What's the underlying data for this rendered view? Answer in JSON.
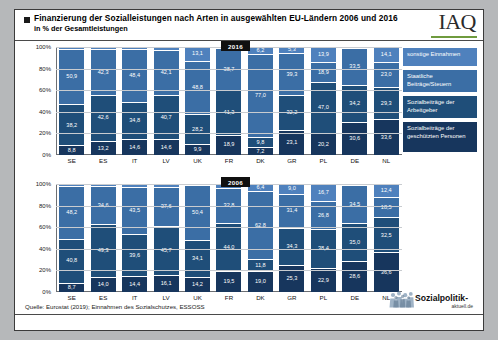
{
  "header": {
    "title_line1": "Finanzierung der Sozialleistungen nach Arten in ausgewählten EU-Ländern 2006 und 2016",
    "title_line2": "in % der Gesamtleistungen",
    "logo": "IAQ"
  },
  "footer": {
    "source": "Quelle: Eurostat (2019); Einnahmen des Sozialschutzes, ESSOSS",
    "brand_main": "Sozialpolitik-",
    "brand_sub": "aktuell.de"
  },
  "legend": {
    "items": [
      {
        "label": "sonstige Einnahmen",
        "color": "#4f81bd"
      },
      {
        "label": "Staatliche Beiträge/Steuern",
        "color": "#3b6ea5"
      },
      {
        "label": "Sozialbeiträge der Arbeitgeber",
        "color": "#1f4e79"
      },
      {
        "label": "Sozialbeiträge der geschützten Personen",
        "color": "#17365d"
      }
    ]
  },
  "axis": {
    "yticks": [
      "100%",
      "80%",
      "60%",
      "40%",
      "20%",
      "0%"
    ]
  },
  "badges": {
    "year_top": "2016",
    "year_bottom": "2006"
  },
  "chart_data": [
    {
      "type": "bar",
      "title": "2016",
      "subtitle": "Finanzierung der Sozialleistungen nach Arten in ausgewählten EU-Ländern 2006 und 2016",
      "stacked": true,
      "normalized": true,
      "xlabel": "",
      "ylabel": "in % der Gesamtleistungen",
      "ylim": [
        0,
        100
      ],
      "yticks": [
        0,
        20,
        40,
        60,
        80,
        100
      ],
      "grid": true,
      "legend_position": "right",
      "categories": [
        "SE",
        "ES",
        "IT",
        "LV",
        "UK",
        "FR",
        "DK",
        "GR",
        "PL",
        "DE",
        "NL"
      ],
      "series": [
        {
          "name": "sonstige Einnahmen",
          "color": "#4f81bd",
          "values": [
            2.1,
            1.9,
            2.2,
            2.6,
            13.1,
            1.1,
            6.2,
            5.3,
            13.9,
            1.2,
            14.1
          ],
          "labels": [
            "",
            "",
            "",
            "",
            "13,1",
            "",
            "6,2",
            "5,3",
            "13,9",
            "",
            "14,1"
          ]
        },
        {
          "name": "Staatliche Beiträge/Steuern",
          "color": "#3b6ea5",
          "values": [
            50.9,
            42.3,
            48.4,
            42.1,
            48.8,
            38.7,
            77.0,
            39.3,
            18.9,
            33.5,
            23.0
          ],
          "labels": [
            "50,9",
            "42,3",
            "48,4",
            "42,1",
            "48,8",
            "38,7",
            "77,0",
            "39,3",
            "18,9",
            "33,5",
            "23,0"
          ]
        },
        {
          "name": "Sozialbeiträge der Arbeitgeber",
          "color": "#1f4e79",
          "values": [
            38.2,
            42.6,
            34.8,
            40.7,
            28.2,
            41.3,
            9.8,
            32.2,
            47.0,
            34.2,
            29.3
          ],
          "labels": [
            "38,2",
            "42,6",
            "34,8",
            "40,7",
            "28,2",
            "41,3",
            "9,8",
            "32,2",
            "47,0",
            "34,2",
            "29,3"
          ]
        },
        {
          "name": "Sozialbeiträge der geschützten Personen",
          "color": "#17365d",
          "values": [
            8.8,
            13.2,
            14.6,
            14.6,
            9.9,
            18.9,
            7.2,
            23.1,
            20.2,
            30.6,
            33.6
          ],
          "labels": [
            "8,8",
            "13,2",
            "14,6",
            "14,6",
            "9,9",
            "18,9",
            "7,2",
            "23,1",
            "20,2",
            "30,6",
            "33,6"
          ]
        }
      ]
    },
    {
      "type": "bar",
      "title": "2006",
      "stacked": true,
      "normalized": true,
      "xlabel": "",
      "ylabel": "in % der Gesamtleistungen",
      "ylim": [
        0,
        100
      ],
      "yticks": [
        0,
        20,
        40,
        60,
        80,
        100
      ],
      "grid": true,
      "legend_position": "right",
      "categories": [
        "SE",
        "ES",
        "IT",
        "LV",
        "UK",
        "FR",
        "DK",
        "GR",
        "PL",
        "DE",
        "NL"
      ],
      "series": [
        {
          "name": "sonstige Einnahmen",
          "color": "#4f81bd",
          "values": [
            2.3,
            2.2,
            2.5,
            2.5,
            1.3,
            3.7,
            6.4,
            9.0,
            16.7,
            1.2,
            12.4
          ],
          "labels": [
            "",
            "",
            "",
            "",
            "",
            "",
            "6,4",
            "9,0",
            "16,7",
            "",
            "12,4"
          ]
        },
        {
          "name": "Staatliche Beiträge/Steuern",
          "color": "#3b6ea5",
          "values": [
            48.2,
            34.6,
            43.5,
            37.6,
            50.4,
            32.8,
            62.8,
            31.4,
            26.8,
            34.5,
            18.5
          ],
          "labels": [
            "48,2",
            "34,6",
            "43,5",
            "37,6",
            "50,4",
            "32,8",
            "62,8",
            "31,4",
            "26,8",
            "34,5",
            "18,5"
          ]
        },
        {
          "name": "Sozialbeiträge der Arbeitgeber",
          "color": "#1f4e79",
          "values": [
            40.8,
            49.3,
            39.6,
            45.7,
            34.1,
            44.0,
            11.8,
            34.3,
            38.4,
            35.0,
            32.5
          ],
          "labels": [
            "40,8",
            "49,3",
            "39,6",
            "45,7",
            "34,1",
            "44,0",
            "11,8",
            "34,3",
            "38,4",
            "35,0",
            "32,5"
          ]
        },
        {
          "name": "Sozialbeiträge der geschützten Personen",
          "color": "#17365d",
          "values": [
            8.7,
            14.0,
            14.4,
            16.1,
            14.2,
            19.5,
            19.0,
            25.3,
            22.9,
            28.6,
            36.6
          ],
          "labels": [
            "8,7",
            "14,0",
            "14,4",
            "16,1",
            "14,2",
            "19,5",
            "19,0",
            "25,3",
            "22,9",
            "28,6",
            "36,6"
          ]
        }
      ]
    }
  ]
}
